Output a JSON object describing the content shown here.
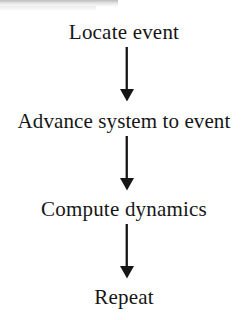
{
  "diagram": {
    "type": "flowchart",
    "orientation": "vertical",
    "title": "",
    "background_color": "#ffffff",
    "text_color": "#161616",
    "arrow_color": "#161616",
    "steps": [
      {
        "id": "locate-event",
        "label": "Locate event"
      },
      {
        "id": "advance-system-to-event",
        "label": "Advance system to event"
      },
      {
        "id": "compute-dynamics",
        "label": "Compute dynamics"
      },
      {
        "id": "repeat",
        "label": "Repeat"
      }
    ],
    "connectors": [
      {
        "id": "connector-1",
        "icon": "arrow-down-icon",
        "from": "locate-event",
        "to": "advance-system-to-event"
      },
      {
        "id": "connector-2",
        "icon": "arrow-down-icon",
        "from": "advance-system-to-event",
        "to": "compute-dynamics"
      },
      {
        "id": "connector-3",
        "icon": "arrow-down-icon",
        "from": "compute-dynamics",
        "to": "repeat"
      }
    ]
  }
}
